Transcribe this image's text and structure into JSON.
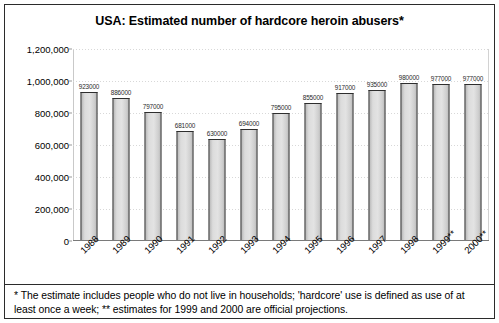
{
  "chart_data": {
    "type": "bar",
    "title": "USA: Estimated number of hardcore heroin abusers*",
    "xlabel": "",
    "ylabel": "",
    "categories": [
      "1988",
      "1989",
      "1990",
      "1991",
      "1992",
      "1993",
      "1994",
      "1995",
      "1996",
      "1997",
      "1998",
      "1999**",
      "2000**"
    ],
    "values": [
      923000,
      886000,
      797000,
      681000,
      630000,
      694000,
      795000,
      855000,
      917000,
      935000,
      980000,
      977000,
      977000
    ],
    "data_labels": [
      "923000",
      "886000",
      "797000",
      "681000",
      "630000",
      "694000",
      "795000",
      "855000",
      "917000",
      "935000",
      "980000",
      "977000",
      "977000"
    ],
    "ylim": [
      0,
      1200000
    ],
    "ytick_values": [
      0,
      200000,
      400000,
      600000,
      800000,
      1000000,
      1200000
    ],
    "ytick_labels": [
      "0",
      "200,000",
      "400,000",
      "600,000",
      "800,000",
      "1,000,000",
      "1,200,000"
    ],
    "grid": true,
    "legend": false,
    "bar_fill_color": "#dcdcdc",
    "bar_edge_color": "#2e2e2e",
    "background_color": "#ffffff",
    "text_color": "#000000"
  },
  "footnote": {
    "text": "* The estimate includes people who do not live in households; 'hardcore' use is defined as use of at least once a week; ** estimates for 1999 and 2000 are official projections."
  }
}
